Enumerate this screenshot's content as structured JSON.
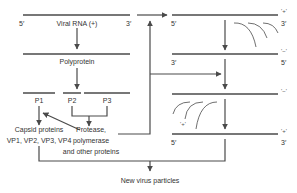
{
  "diagram": {
    "colors": {
      "line": "#4a4a4a",
      "text": "#333333",
      "background": "#ffffff"
    },
    "left": {
      "viral_rna": {
        "label": "Viral RNA (+)",
        "end5": "5′",
        "end3": "3′"
      },
      "polyprotein": {
        "label": "Polyprotein"
      },
      "segments": [
        {
          "id": "P1",
          "label": "P1"
        },
        {
          "id": "P2",
          "label": "P2"
        },
        {
          "id": "P3",
          "label": "P3"
        }
      ],
      "capsid": {
        "line1": "Capsid proteins",
        "line2": "VP1, VP2, VP3, VP4"
      },
      "nonstructural": {
        "line1": "Protease,",
        "line2": "polymerase",
        "line3": "and other proteins"
      }
    },
    "right": {
      "strands": [
        {
          "sense": "'+'",
          "left_end": "5′",
          "right_end": "3′"
        },
        {
          "sense": "'−'",
          "left_end": "3′",
          "right_end": "5′"
        },
        {
          "sense": "'−'",
          "left_end": "",
          "right_end": ""
        },
        {
          "sense": "'+'",
          "left_end": "5′",
          "right_end": "3′"
        }
      ],
      "nascent_label": "'+'"
    },
    "output": {
      "label": "New virus particles"
    }
  }
}
